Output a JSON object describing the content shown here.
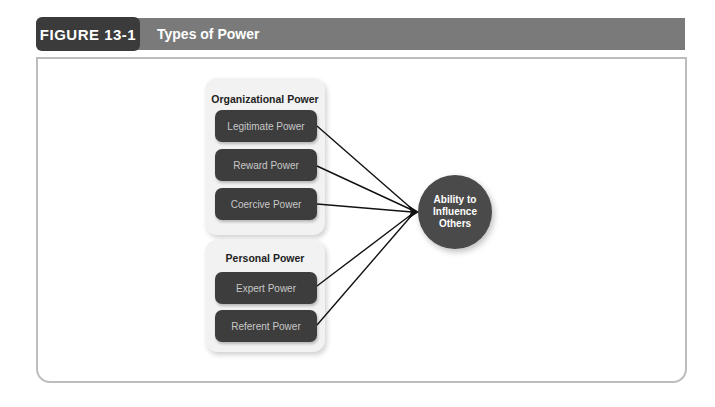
{
  "header": {
    "figure_label": "FIGURE 13-1",
    "title": "Types of Power"
  },
  "diagram": {
    "groups": [
      {
        "title": "Organizational Power",
        "items": [
          "Legitimate Power",
          "Reward Power",
          "Coercive Power"
        ]
      },
      {
        "title": "Personal Power",
        "items": [
          "Expert Power",
          "Referent Power"
        ]
      }
    ],
    "target": {
      "line1": "Ability to",
      "line2": "Influence",
      "line3": "Others"
    }
  },
  "colors": {
    "header_label_bg": "#3b3b3b",
    "header_bar_bg": "#7a7a7a",
    "box_bg": "#3d3d3d",
    "panel_bg": "#f2f2f2",
    "circle_bg": "#4a4a4a"
  }
}
